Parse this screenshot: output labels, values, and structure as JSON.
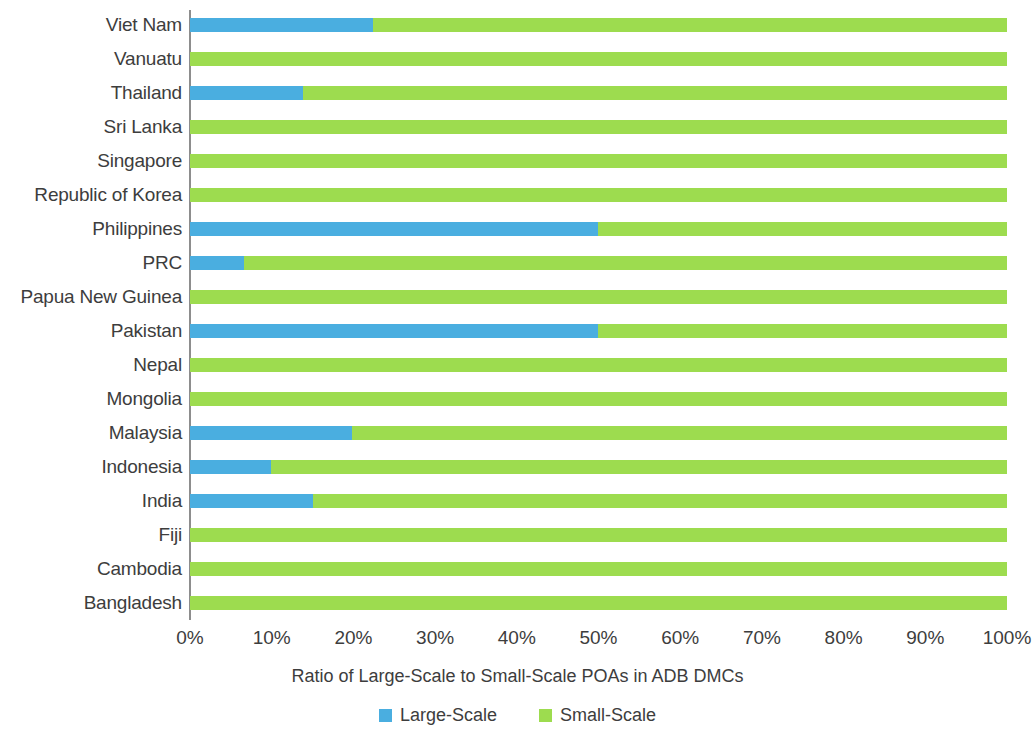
{
  "chart_data": {
    "type": "bar",
    "orientation": "horizontal",
    "stacked": true,
    "stack_mode": "percent",
    "title": "",
    "xlabel": "Ratio of Large-Scale to Small-Scale POAs in ADB DMCs",
    "ylabel": "",
    "xlim": [
      0,
      100
    ],
    "xticks": [
      0,
      10,
      20,
      30,
      40,
      50,
      60,
      70,
      80,
      90,
      100
    ],
    "xtick_labels": [
      "0%",
      "10%",
      "20%",
      "30%",
      "40%",
      "50%",
      "60%",
      "70%",
      "80%",
      "90%",
      "100%"
    ],
    "grid": false,
    "legend_position": "bottom",
    "categories": [
      "Viet Nam",
      "Vanuatu",
      "Thailand",
      "Sri Lanka",
      "Singapore",
      "Republic of Korea",
      "Philippines",
      "PRC",
      "Papua New Guinea",
      "Pakistan",
      "Nepal",
      "Mongolia",
      "Malaysia",
      "Indonesia",
      "India",
      "Fiji",
      "Cambodia",
      "Bangladesh"
    ],
    "series": [
      {
        "name": "Large-Scale",
        "color": "#4aaee0",
        "values": [
          22.4,
          0,
          13.8,
          0,
          0,
          0,
          49.9,
          6.6,
          0,
          49.9,
          0,
          0,
          19.8,
          9.9,
          15.1,
          0,
          0,
          0
        ]
      },
      {
        "name": "Small-Scale",
        "color": "#9ddc4f",
        "values": [
          77.6,
          100,
          86.2,
          100,
          100,
          100,
          50.1,
          93.4,
          100,
          50.1,
          100,
          100,
          80.2,
          90.1,
          84.9,
          100,
          100,
          100
        ]
      }
    ]
  },
  "legend": {
    "items": [
      {
        "label": "Large-Scale",
        "color": "#4aaee0"
      },
      {
        "label": "Small-Scale",
        "color": "#9ddc4f"
      }
    ]
  },
  "axis_title": "Ratio of Large-Scale to Small-Scale POAs in ADB DMCs"
}
